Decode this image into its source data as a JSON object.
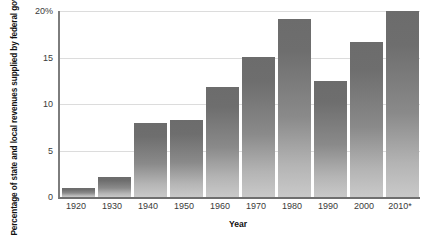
{
  "chart_data": {
    "type": "bar",
    "title": "",
    "subtitle": "",
    "xlabel": "Year",
    "ylabel": "Percentage of state and local revenues supplied by federal government",
    "categories": [
      "1920",
      "1930",
      "1940",
      "1950",
      "1960",
      "1970",
      "1980",
      "1990",
      "2000",
      "2010*"
    ],
    "values": [
      1.0,
      2.1,
      8.0,
      8.3,
      11.8,
      15.1,
      19.1,
      12.5,
      16.7,
      20.0
    ],
    "ylim": [
      0,
      20
    ],
    "yticks": [
      0,
      5,
      10,
      15,
      20
    ],
    "ytick_labels": [
      "0",
      "5",
      "10",
      "15",
      "20%"
    ],
    "grid": true,
    "gridlines_axis": "y",
    "legend": false,
    "legend_position": "none",
    "bar_color": "#808080",
    "grid_color": "#dcdcdc",
    "axis_color": "#7d7d7d",
    "text_color": "#333333",
    "annotations": [
      "* 2010 value is marked with an asterisk"
    ]
  }
}
